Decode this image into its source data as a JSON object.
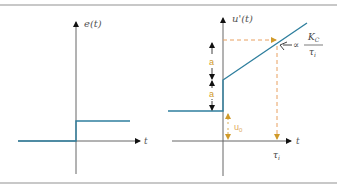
{
  "left_plot": {
    "y_label": "e(t)",
    "x_label": "t"
  },
  "right_plot": {
    "y_label": "u'(t)",
    "x_label": "t",
    "a_label_upper": "a",
    "a_label_lower": "a",
    "u0_label": "u",
    "u0_sub": "0",
    "tau_label": "τ",
    "tau_sub": "i",
    "slope_prefix": "∝",
    "slope_numerator": "K",
    "slope_numerator_sub": "C",
    "slope_denominator": "τ",
    "slope_denominator_sub": "i"
  },
  "colors": {
    "signal": "#2f7f9e",
    "dashed": "#e8a060",
    "annotation_orange": "#d09a2a",
    "axis": "#555555",
    "border": "#c8c8c8"
  }
}
